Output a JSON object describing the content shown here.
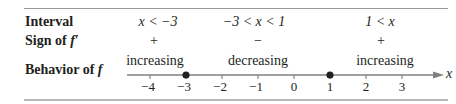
{
  "table": {
    "row_labels": {
      "interval": "Interval",
      "sign_prefix": "Sign of ",
      "sign_fn": "f′",
      "behavior_prefix": "Behavior of ",
      "behavior_fn": "f"
    },
    "intervals": [
      {
        "interval": "x < −3",
        "sign": "+",
        "behavior": "increasing"
      },
      {
        "interval": "−3 < x < 1",
        "sign": "−",
        "behavior": "decreasing"
      },
      {
        "interval": "1 < x",
        "sign": "+",
        "behavior": "increasing"
      }
    ]
  },
  "number_line": {
    "axis_label": "x",
    "ticks": [
      "−4",
      "−3",
      "−2",
      "−1",
      "0",
      "1",
      "2",
      "3"
    ],
    "critical_points": [
      "−3",
      "1"
    ],
    "line_color": "#808080",
    "point_color": "#231f20"
  }
}
